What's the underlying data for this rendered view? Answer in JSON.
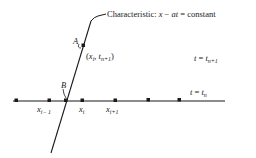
{
  "diagram": {
    "characteristic_label": {
      "prefix": "Characteristic: ",
      "expr_x": "x",
      "minus": " − ",
      "expr_at": "at",
      "equals": " = constant"
    },
    "point_A": "A",
    "point_B": "B",
    "point_coord": {
      "open": "(",
      "x": "x",
      "x_sub": "i",
      "comma": ", ",
      "t": "t",
      "t_sub": "n+1",
      "close": ")"
    },
    "level_upper": {
      "lhs": "t",
      "eq": " = ",
      "rhs": "t",
      "sub": "n+1"
    },
    "level_lower": {
      "lhs": "t",
      "eq": " = ",
      "rhs": "t",
      "sub": "n"
    },
    "grid_labels": [
      {
        "base": "x",
        "sub": "i− 1"
      },
      {
        "base": "x",
        "sub": "i"
      },
      {
        "base": "x",
        "sub": "i+1"
      }
    ],
    "colors": {
      "ink": "#1a1a1a",
      "background": "#ffffff"
    }
  }
}
